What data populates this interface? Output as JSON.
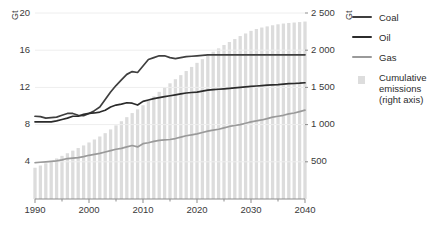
{
  "axes": {
    "left": {
      "unit": "Gt",
      "ticks": [
        "20",
        "16",
        "12",
        "8",
        "4"
      ],
      "min": 0,
      "max": 20
    },
    "right": {
      "unit": "Gt",
      "ticks": [
        "2 500",
        "2 000",
        "1 500",
        "1 000",
        "500"
      ],
      "min": 0,
      "max": 2500
    },
    "x": {
      "ticks": [
        "1990",
        "2000",
        "2010",
        "2020",
        "2030",
        "2040"
      ],
      "min": 1990,
      "max": 2040
    }
  },
  "legend": {
    "items": [
      {
        "label": "Coal",
        "marker": "line",
        "color": "#3f3f3f"
      },
      {
        "label": "Oil",
        "marker": "line",
        "color": "#2b2b2b"
      },
      {
        "label": "Gas",
        "marker": "line",
        "color": "#9a9a9a"
      },
      {
        "label": "Cumulative\nemissions\n(right axis)",
        "marker": "box",
        "color": "#dddddd"
      }
    ]
  },
  "colors": {
    "coal": "#3f3f3f",
    "oil": "#2b2b2b",
    "gas": "#9a9a9a",
    "bars": "#dcdcdc",
    "gridline": "#eeeeee",
    "axis": "#8d8d8d",
    "text": "#333333"
  },
  "chart_data": {
    "type": "line",
    "title": "",
    "xlabel": "",
    "ylabel": "Gt",
    "xlim": [
      1990,
      2040
    ],
    "ylim": [
      0,
      20
    ],
    "y2lim": [
      0,
      2500
    ],
    "y2label": "Gt",
    "grid": true,
    "legend_position": "right",
    "x": [
      1990,
      1991,
      1992,
      1993,
      1994,
      1995,
      1996,
      1997,
      1998,
      1999,
      2000,
      2001,
      2002,
      2003,
      2004,
      2005,
      2006,
      2007,
      2008,
      2009,
      2010,
      2011,
      2012,
      2013,
      2014,
      2015,
      2016,
      2017,
      2018,
      2019,
      2020,
      2021,
      2022,
      2023,
      2024,
      2025,
      2026,
      2027,
      2028,
      2029,
      2030,
      2031,
      2032,
      2033,
      2034,
      2035,
      2036,
      2037,
      2038,
      2039,
      2040
    ],
    "series": [
      {
        "name": "Coal",
        "axis": "left",
        "color": "#3f3f3f",
        "values": [
          8.9,
          8.85,
          8.7,
          8.75,
          8.8,
          9.0,
          9.2,
          9.2,
          9.0,
          8.95,
          9.2,
          9.5,
          9.9,
          10.7,
          11.5,
          12.2,
          12.8,
          13.4,
          13.7,
          13.6,
          14.3,
          15.0,
          15.2,
          15.4,
          15.4,
          15.2,
          15.1,
          15.2,
          15.3,
          15.35,
          15.4,
          15.45,
          15.5,
          15.5,
          15.5,
          15.5,
          15.5,
          15.5,
          15.5,
          15.5,
          15.5,
          15.5,
          15.5,
          15.5,
          15.5,
          15.5,
          15.5,
          15.5,
          15.5,
          15.5,
          15.5
        ]
      },
      {
        "name": "Oil",
        "axis": "left",
        "color": "#2b2b2b",
        "values": [
          8.3,
          8.3,
          8.3,
          8.3,
          8.4,
          8.55,
          8.7,
          8.9,
          8.9,
          9.1,
          9.2,
          9.25,
          9.35,
          9.55,
          9.9,
          10.1,
          10.2,
          10.35,
          10.3,
          10.1,
          10.5,
          10.65,
          10.8,
          10.9,
          11.0,
          11.1,
          11.2,
          11.3,
          11.4,
          11.45,
          11.5,
          11.6,
          11.7,
          11.75,
          11.8,
          11.85,
          11.9,
          11.95,
          12.0,
          12.05,
          12.1,
          12.15,
          12.2,
          12.25,
          12.28,
          12.3,
          12.35,
          12.4,
          12.42,
          12.45,
          12.5
        ]
      },
      {
        "name": "Gas",
        "axis": "left",
        "color": "#9a9a9a",
        "values": [
          3.9,
          3.95,
          4.0,
          4.05,
          4.1,
          4.2,
          4.35,
          4.4,
          4.45,
          4.55,
          4.7,
          4.8,
          4.9,
          5.05,
          5.2,
          5.35,
          5.45,
          5.6,
          5.75,
          5.6,
          5.95,
          6.05,
          6.2,
          6.3,
          6.35,
          6.4,
          6.5,
          6.65,
          6.8,
          6.9,
          7.0,
          7.15,
          7.3,
          7.4,
          7.5,
          7.65,
          7.8,
          7.9,
          8.0,
          8.15,
          8.3,
          8.4,
          8.5,
          8.65,
          8.8,
          8.9,
          9.0,
          9.15,
          9.25,
          9.4,
          9.55
        ]
      },
      {
        "name": "Cumulative emissions",
        "axis": "right",
        "type": "bar",
        "color": "#dcdcdc",
        "values": [
          420,
          450,
          480,
          510,
          545,
          580,
          615,
          650,
          685,
          720,
          760,
          800,
          840,
          885,
          935,
          990,
          1045,
          1100,
          1155,
          1205,
          1260,
          1320,
          1380,
          1440,
          1500,
          1555,
          1610,
          1665,
          1720,
          1775,
          1830,
          1880,
          1930,
          1980,
          2025,
          2070,
          2110,
          2150,
          2190,
          2225,
          2260,
          2285,
          2305,
          2320,
          2335,
          2348,
          2358,
          2366,
          2372,
          2378,
          2385
        ]
      }
    ]
  }
}
